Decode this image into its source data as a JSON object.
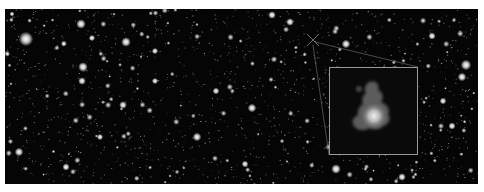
{
  "image": {
    "description": "Deep-field astronomical image with a zoomed inset highlighting a faint galaxy",
    "background_color": "#050505",
    "frame_color": "#ffffff",
    "marker": {
      "shape": "x-cross",
      "x": 308,
      "y": 31
    },
    "inset": {
      "border_color": "#9a9a9a",
      "subject": "fuzzy irregular galaxy with bright core",
      "core_color": "#e8e8e8",
      "halo_color": "#5a5a5a"
    },
    "bright_objects": [
      {
        "x": 21,
        "y": 30,
        "r": 3.0
      },
      {
        "x": 76,
        "y": 15,
        "r": 2.0
      },
      {
        "x": 121,
        "y": 33,
        "r": 2.0
      },
      {
        "x": 78,
        "y": 58,
        "r": 2.0
      },
      {
        "x": 77,
        "y": 72,
        "r": 1.6
      },
      {
        "x": 87,
        "y": 29,
        "r": 1.3
      },
      {
        "x": 150,
        "y": 42,
        "r": 1.3
      },
      {
        "x": 14,
        "y": 143,
        "r": 1.8
      },
      {
        "x": 61,
        "y": 158,
        "r": 1.5
      },
      {
        "x": 118,
        "y": 96,
        "r": 1.6
      },
      {
        "x": 192,
        "y": 128,
        "r": 1.8
      },
      {
        "x": 150,
        "y": 72,
        "r": 1.3
      },
      {
        "x": 95,
        "y": 128,
        "r": 1.3
      },
      {
        "x": 247,
        "y": 99,
        "r": 1.8
      },
      {
        "x": 267,
        "y": 6,
        "r": 1.6
      },
      {
        "x": 285,
        "y": 13,
        "r": 1.6
      },
      {
        "x": 211,
        "y": 82,
        "r": 1.4
      },
      {
        "x": 341,
        "y": 35,
        "r": 1.8
      },
      {
        "x": 427,
        "y": 27,
        "r": 1.5
      },
      {
        "x": 461,
        "y": 56,
        "r": 2.2
      },
      {
        "x": 457,
        "y": 68,
        "r": 1.8
      },
      {
        "x": 438,
        "y": 92,
        "r": 1.4
      },
      {
        "x": 447,
        "y": 117,
        "r": 1.5
      },
      {
        "x": 331,
        "y": 160,
        "r": 2.0
      },
      {
        "x": 397,
        "y": 168,
        "r": 1.6
      },
      {
        "x": 240,
        "y": 155,
        "r": 1.4
      },
      {
        "x": 7,
        "y": 5,
        "r": 1.0
      }
    ]
  }
}
